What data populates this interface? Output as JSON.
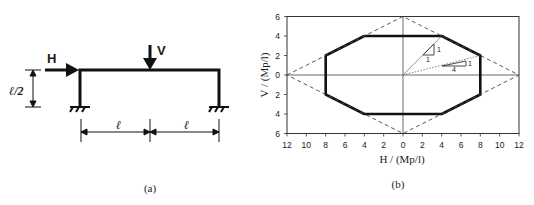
{
  "figure_a": {
    "caption": "(a)",
    "load_h_label": "H",
    "load_v_label": "V",
    "height_dim_label": "ℓ/2",
    "span_left_label": "ℓ",
    "span_right_label": "ℓ"
  },
  "figure_b": {
    "caption": "(b)"
  },
  "chart_data": {
    "type": "line",
    "title": "",
    "xlabel": "H / (Mp/l)",
    "ylabel": "V / (Mp/l)",
    "xlim": [
      -12,
      12
    ],
    "ylim": [
      -6,
      6
    ],
    "x_ticks": [
      -12,
      -10,
      -8,
      -6,
      -4,
      -2,
      0,
      2,
      4,
      6,
      8,
      10,
      12
    ],
    "x_tick_labels": [
      "12",
      "10",
      "8",
      "6",
      "4",
      "2",
      "0",
      "2",
      "4",
      "6",
      "8",
      "10",
      "12"
    ],
    "y_ticks": [
      6,
      4,
      2,
      0,
      -2,
      -4,
      -6
    ],
    "y_tick_labels": [
      "6",
      "4",
      "2",
      "0",
      "2",
      "4",
      "6"
    ],
    "grid": false,
    "legend": null,
    "series": [
      {
        "name": "interaction-octagon",
        "style": "solid-thick",
        "points": [
          [
            -4,
            4
          ],
          [
            4,
            4
          ],
          [
            8,
            2
          ],
          [
            8,
            -2
          ],
          [
            4,
            -4
          ],
          [
            -4,
            -4
          ],
          [
            -8,
            -2
          ],
          [
            -8,
            2
          ],
          [
            -4,
            4
          ]
        ]
      },
      {
        "name": "outer-diamond",
        "style": "dashed",
        "points": [
          [
            -12,
            0
          ],
          [
            0,
            6
          ],
          [
            12,
            0
          ],
          [
            0,
            -6
          ],
          [
            -12,
            0
          ]
        ]
      },
      {
        "name": "ray-slope-1",
        "style": "thin-solid",
        "points": [
          [
            0,
            0
          ],
          [
            4,
            4
          ]
        ]
      },
      {
        "name": "ray-slope-1-4",
        "style": "thin-dotted",
        "points": [
          [
            0,
            0
          ],
          [
            8,
            2
          ]
        ]
      }
    ],
    "annotations": [
      {
        "type": "slope-triangle",
        "rise_label": "1",
        "run_label": "1"
      },
      {
        "type": "slope-triangle",
        "rise_label": "1",
        "run_label": "4"
      }
    ]
  }
}
